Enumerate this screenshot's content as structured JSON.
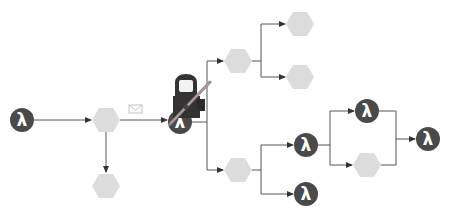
{
  "diagram": {
    "type": "workflow",
    "colors": {
      "lambda_fill": "#4a4a4a",
      "lambda_glyph": "#ffffff",
      "hex_fill": "#dcdcdc",
      "edge": "#555555",
      "envelope": "#bdbdbd",
      "figure": "#333333",
      "figure_face": "#f2f2f2",
      "pole": "#9a8888"
    },
    "lambda_glyph": "λ",
    "nodes": [
      {
        "id": "lambda-start",
        "kind": "lambda",
        "x": 22,
        "y": 120
      },
      {
        "id": "hex-a",
        "kind": "hex",
        "x": 106,
        "y": 120
      },
      {
        "id": "hex-a-down",
        "kind": "hex",
        "x": 106,
        "y": 186
      },
      {
        "id": "lambda-center",
        "kind": "lambda",
        "x": 180,
        "y": 122
      },
      {
        "id": "hex-upper",
        "kind": "hex",
        "x": 238,
        "y": 61
      },
      {
        "id": "hex-top-1",
        "kind": "hex",
        "x": 300,
        "y": 24
      },
      {
        "id": "hex-top-2",
        "kind": "hex",
        "x": 300,
        "y": 77
      },
      {
        "id": "hex-lower",
        "kind": "hex",
        "x": 238,
        "y": 170
      },
      {
        "id": "lambda-mid",
        "kind": "lambda",
        "x": 306,
        "y": 145
      },
      {
        "id": "lambda-bottom",
        "kind": "lambda",
        "x": 306,
        "y": 194
      },
      {
        "id": "lambda-par-top",
        "kind": "lambda",
        "x": 367,
        "y": 111
      },
      {
        "id": "hex-par-bottom",
        "kind": "hex",
        "x": 367,
        "y": 165
      },
      {
        "id": "lambda-end",
        "kind": "lambda",
        "x": 428,
        "y": 139
      }
    ],
    "edges": [
      {
        "from": "lambda-start",
        "to": "hex-a"
      },
      {
        "from": "hex-a",
        "to": "hex-a-down"
      },
      {
        "from": "hex-a",
        "to": "lambda-center",
        "label_icon": "envelope-icon"
      },
      {
        "from": "lambda-center",
        "to": "hex-upper"
      },
      {
        "from": "lambda-center",
        "to": "hex-lower"
      },
      {
        "from": "hex-upper",
        "to": "hex-top-1"
      },
      {
        "from": "hex-upper",
        "to": "hex-top-2"
      },
      {
        "from": "hex-lower",
        "to": "lambda-mid"
      },
      {
        "from": "hex-lower",
        "to": "lambda-bottom"
      },
      {
        "from": "lambda-mid",
        "to": "lambda-par-top"
      },
      {
        "from": "lambda-mid",
        "to": "hex-par-bottom"
      },
      {
        "from": "lambda-par-top",
        "to": "lambda-end"
      },
      {
        "from": "hex-par-bottom",
        "to": "lambda-end"
      }
    ],
    "overlay": {
      "icon": "hooded-worker-with-pole-icon",
      "anchor": "lambda-center"
    }
  }
}
